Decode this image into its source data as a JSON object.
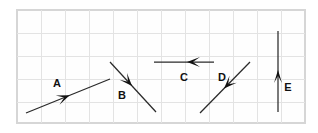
{
  "figure": {
    "title": "",
    "background_color": "#ffffff",
    "frame": {
      "x": 17,
      "y": 10,
      "width": 288,
      "height": 113,
      "fill_color": "#fefefe",
      "border_color": "#d6d6d6"
    },
    "grid": {
      "visible": true,
      "color": "#e3e3e3",
      "spacing_x": 24,
      "spacing_y": 23,
      "x_positions": [
        41,
        65,
        89,
        113,
        137,
        161,
        185,
        209,
        233,
        257,
        281
      ],
      "y_positions": [
        33,
        56,
        79,
        102
      ]
    },
    "line_color": "#2a2a2a",
    "arrowhead_color": "#121212",
    "label_color": "#111111"
  },
  "vectors": [
    {
      "label": "A",
      "direction": "up-right",
      "x1": 26,
      "y1": 113,
      "x2": 110,
      "y2": 79,
      "head_t": 0.52,
      "head_len": 13,
      "head_half_width": 5,
      "label_x": 57,
      "label_y": 84
    },
    {
      "label": "B",
      "direction": "down-right",
      "x1": 110,
      "y1": 62,
      "x2": 156,
      "y2": 112,
      "head_t": 0.48,
      "head_len": 13,
      "head_half_width": 5,
      "label_x": 122,
      "label_y": 96
    },
    {
      "label": "C",
      "direction": "left",
      "x1": 214,
      "y1": 62,
      "x2": 154,
      "y2": 62,
      "head_t": 0.45,
      "head_len": 13,
      "head_half_width": 5,
      "label_x": 184,
      "label_y": 78
    },
    {
      "label": "D",
      "direction": "down-left",
      "x1": 250,
      "y1": 62,
      "x2": 200,
      "y2": 113,
      "head_t": 0.52,
      "head_len": 13,
      "head_half_width": 5,
      "label_x": 222,
      "label_y": 78
    },
    {
      "label": "E",
      "direction": "up",
      "x1": 278,
      "y1": 112,
      "x2": 278,
      "y2": 31,
      "head_t": 0.52,
      "head_len": 13,
      "head_half_width": 4,
      "label_x": 288,
      "label_y": 88
    }
  ]
}
